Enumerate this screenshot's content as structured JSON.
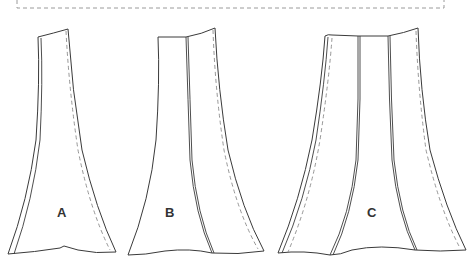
{
  "diagram": {
    "type": "sewing-pattern-pieces",
    "frame": {
      "style": "dashed",
      "color": "#9a9a9a"
    },
    "line_color": "#3a3a3a",
    "seam_allowance_color": "#8a8a8a",
    "panels": [
      {
        "id": "A",
        "label": "A",
        "pieces": 1
      },
      {
        "id": "B",
        "label": "B",
        "pieces": 2
      },
      {
        "id": "C",
        "label": "C",
        "pieces": 3
      }
    ]
  }
}
